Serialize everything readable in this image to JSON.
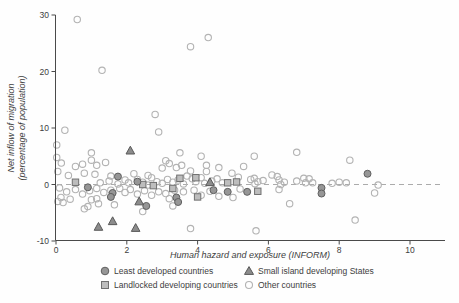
{
  "chart_data": {
    "type": "scatter",
    "xlabel": "Human hazard and exposure (INFORM)",
    "ylabel_line1": "Net inflow of migration",
    "ylabel_line2": "(percentage of population)",
    "xlim": [
      0,
      11
    ],
    "ylim": [
      -10,
      30
    ],
    "xticks": [
      0,
      2,
      4,
      6,
      8,
      10
    ],
    "yticks": [
      -10,
      0,
      10,
      20,
      30
    ],
    "grid": "off",
    "reference_line_y": 0,
    "legend_position": "bottom",
    "colors": {
      "axis": "#4a4a4a",
      "reference_line": "#ababab",
      "least_developed_fill": "#969696",
      "least_developed_stroke": "#5f5f5f",
      "landlocked_fill": "#bdbdbd",
      "landlocked_stroke": "#707070",
      "small_island_fill": "#8c8c8c",
      "small_island_stroke": "#595959",
      "other_stroke": "#b3b3b3"
    },
    "series": [
      {
        "name": "Least developed countries",
        "marker": "circle-filled",
        "points": [
          [
            1.75,
            1.4
          ],
          [
            2.3,
            0.5
          ],
          [
            0.9,
            -0.5
          ],
          [
            1.6,
            -1.5
          ],
          [
            1.55,
            -2.2
          ],
          [
            2.55,
            -3.8
          ],
          [
            3.4,
            -2.3
          ],
          [
            3.45,
            -3.1
          ],
          [
            4.45,
            -1.0
          ],
          [
            4.85,
            -1.3
          ],
          [
            5.4,
            -1.3
          ],
          [
            7.5,
            -0.6
          ],
          [
            7.5,
            -1.6
          ],
          [
            8.8,
            1.9
          ]
        ]
      },
      {
        "name": "Landlocked developing countries",
        "marker": "square-filled",
        "points": [
          [
            0.55,
            0.4
          ],
          [
            2.45,
            0.0
          ],
          [
            2.75,
            -0.2
          ],
          [
            3.3,
            -0.7
          ],
          [
            3.5,
            1.1
          ],
          [
            3.95,
            1.2
          ],
          [
            4.0,
            -2.2
          ],
          [
            4.85,
            0.3
          ],
          [
            5.1,
            0.45
          ],
          [
            5.7,
            -1.2
          ]
        ]
      },
      {
        "name": "Small island developing States",
        "marker": "triangle-filled",
        "points": [
          [
            2.1,
            6.0
          ],
          [
            4.35,
            0.4
          ],
          [
            2.35,
            -3.0
          ],
          [
            1.2,
            -7.5
          ],
          [
            1.6,
            -6.5
          ],
          [
            2.25,
            -7.7
          ]
        ]
      },
      {
        "name": "Other countries",
        "marker": "circle-open",
        "points": [
          [
            0.6,
            29.2
          ],
          [
            1.3,
            20.2
          ],
          [
            3.8,
            24.4
          ],
          [
            4.3,
            26.0
          ],
          [
            2.8,
            12.4
          ],
          [
            0.25,
            9.6
          ],
          [
            2.9,
            9.3
          ],
          [
            0.02,
            7.0
          ],
          [
            1.0,
            5.6
          ],
          [
            3.5,
            5.6
          ],
          [
            4.1,
            5.0
          ],
          [
            5.6,
            5.0
          ],
          [
            6.8,
            5.7
          ],
          [
            0.02,
            4.8
          ],
          [
            1.0,
            4.3
          ],
          [
            3.1,
            4.2
          ],
          [
            8.3,
            4.3
          ],
          [
            0.15,
            3.8
          ],
          [
            0.55,
            3.2
          ],
          [
            0.75,
            3.6
          ],
          [
            1.15,
            3.4
          ],
          [
            1.4,
            3.9
          ],
          [
            3.2,
            3.7
          ],
          [
            3.0,
            2.9
          ],
          [
            3.4,
            3.0
          ],
          [
            3.55,
            3.4
          ],
          [
            4.25,
            3.4
          ],
          [
            4.6,
            3.0
          ],
          [
            5.3,
            3.2
          ],
          [
            0.05,
            2.3
          ],
          [
            0.35,
            1.6
          ],
          [
            0.8,
            2.0
          ],
          [
            1.1,
            1.8
          ],
          [
            1.55,
            1.5
          ],
          [
            2.2,
            1.9
          ],
          [
            2.6,
            1.6
          ],
          [
            3.8,
            2.4
          ],
          [
            4.25,
            2.3
          ],
          [
            4.97,
            2.0
          ],
          [
            6.1,
            1.7
          ],
          [
            6.25,
            1.4
          ],
          [
            1.25,
            0.3
          ],
          [
            1.5,
            0.6
          ],
          [
            1.75,
            0.1
          ],
          [
            1.95,
            0.8
          ],
          [
            2.05,
            0.3
          ],
          [
            2.3,
            0.9
          ],
          [
            2.45,
            0.4
          ],
          [
            2.6,
            -0.1
          ],
          [
            2.7,
            1.2
          ],
          [
            2.85,
            0.5
          ],
          [
            3.0,
            0.2
          ],
          [
            3.15,
            0.9
          ],
          [
            3.3,
            0.4
          ],
          [
            3.45,
            0.8
          ],
          [
            3.6,
            0.1
          ],
          [
            3.7,
            1.5
          ],
          [
            3.85,
            1.0
          ],
          [
            3.95,
            0.5
          ],
          [
            4.1,
            1.2
          ],
          [
            4.2,
            0.2
          ],
          [
            4.4,
            0.6
          ],
          [
            4.55,
            1.0
          ],
          [
            4.7,
            0.3
          ],
          [
            5.15,
            1.3
          ],
          [
            5.5,
            0.9
          ],
          [
            5.6,
            1.1
          ],
          [
            5.7,
            0.5
          ],
          [
            5.62,
            0.15
          ],
          [
            5.85,
            0.7
          ],
          [
            6.3,
            0.8
          ],
          [
            6.35,
            0.0
          ],
          [
            6.45,
            0.4
          ],
          [
            6.8,
            0.6
          ],
          [
            7.0,
            1.1
          ],
          [
            7.05,
            0.3
          ],
          [
            7.15,
            1.0
          ],
          [
            7.25,
            0.3
          ],
          [
            7.8,
            0.2
          ],
          [
            8.0,
            0.4
          ],
          [
            8.2,
            0.3
          ],
          [
            9.1,
            -0.1
          ],
          [
            0.1,
            -0.6
          ],
          [
            0.3,
            -1.3
          ],
          [
            0.55,
            -0.9
          ],
          [
            0.75,
            -1.7
          ],
          [
            0.95,
            -1.1
          ],
          [
            1.15,
            -0.7
          ],
          [
            1.35,
            -1.4
          ],
          [
            1.55,
            -1.0
          ],
          [
            1.8,
            -0.7
          ],
          [
            1.95,
            -1.4
          ],
          [
            2.1,
            -0.9
          ],
          [
            2.3,
            -1.7
          ],
          [
            2.5,
            -1.1
          ],
          [
            2.7,
            -1.9
          ],
          [
            2.9,
            -1.3
          ],
          [
            3.1,
            -1.6
          ],
          [
            3.35,
            -1.0
          ],
          [
            3.6,
            -1.3
          ],
          [
            3.9,
            -1.0
          ],
          [
            4.1,
            -1.9
          ],
          [
            4.35,
            -1.2
          ],
          [
            5.2,
            -0.8
          ],
          [
            6.3,
            -0.9
          ],
          [
            9.0,
            -1.5
          ],
          [
            0.05,
            -3.0
          ],
          [
            0.2,
            -3.2
          ],
          [
            0.14,
            -2.3
          ],
          [
            0.4,
            -2.6
          ],
          [
            0.8,
            -4.3
          ],
          [
            0.9,
            -3.9
          ],
          [
            1.0,
            -2.7
          ],
          [
            1.15,
            -2.5
          ],
          [
            1.2,
            -3.4
          ],
          [
            1.65,
            -3.6
          ],
          [
            3.2,
            -2.5
          ],
          [
            3.3,
            -3.8
          ],
          [
            4.6,
            -2.1
          ],
          [
            5.0,
            -2.3
          ],
          [
            6.6,
            -3.4
          ],
          [
            2.45,
            -4.8
          ],
          [
            3.8,
            -7.8
          ],
          [
            5.65,
            -8.2
          ],
          [
            8.45,
            -6.3
          ]
        ]
      }
    ]
  },
  "legend": {
    "items": [
      {
        "label": "Least developed countries"
      },
      {
        "label": "Landlocked developing countries"
      },
      {
        "label": "Small island developing States"
      },
      {
        "label": "Other countries"
      }
    ]
  }
}
